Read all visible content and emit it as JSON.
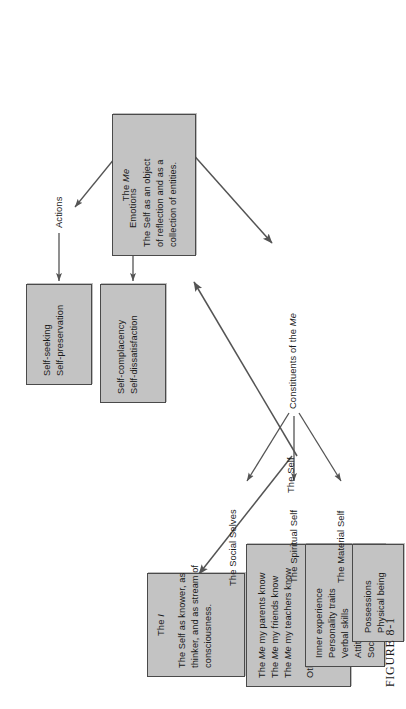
{
  "figure": {
    "caption_label": "FIGURE",
    "caption_number": "8-1"
  },
  "colors": {
    "box_fill": "#c3c3c3",
    "box_border": "#4a4a4a",
    "arrow": "#545454",
    "text": "#1a1a1a",
    "page": "#ffffff"
  },
  "diagram": {
    "type": "tree",
    "root": {
      "label": "The Self"
    },
    "nodes": {
      "the_i": {
        "title_prefix": "The ",
        "title_italic": "I",
        "body": [
          "The Self as knower, as",
          "thinker, and as stream of",
          "consciousness."
        ]
      },
      "the_me": {
        "title_prefix": "The ",
        "title_italic": "Me",
        "body": [
          "The Self as an object",
          "of reflection and as a",
          "collection of entities."
        ]
      },
      "emotions": {
        "label": "Emotions"
      },
      "actions": {
        "label": "Actions"
      },
      "emotions_box": {
        "items": [
          "Self-complacency",
          "Self-dissatisfaction"
        ]
      },
      "actions_box": {
        "items": [
          "Self-seeking",
          "Self-preservation"
        ]
      },
      "constituents": {
        "label_prefix": "Constituents of the ",
        "label_italic": "Me"
      },
      "material_self": {
        "label": "The Material Self",
        "items": [
          "Possessions",
          "Physical being"
        ]
      },
      "spiritual_self": {
        "label": "The Spiritual Self",
        "items": [
          "Inner experience",
          "Personality traits",
          "Verbal skills",
          "Attitudes",
          "Social perceptions"
        ]
      },
      "social_selves": {
        "label": "The Social Selves",
        "items_a": [
          {
            "pre": "The ",
            "it": "Me",
            "post": " my parents know"
          },
          {
            "pre": "The ",
            "it": "Me",
            "post": " my friends know"
          },
          {
            "pre": "The ",
            "it": "Me",
            "post": " my teachers know"
          }
        ],
        "items_b": [
          {
            "pre": "Other Social  ",
            "it": "Mes",
            "post": ""
          }
        ]
      }
    },
    "edges": [
      {
        "from": "The Self",
        "to": "The I"
      },
      {
        "from": "The Self",
        "to": "The Me"
      },
      {
        "from": "The Me",
        "to": "Emotions"
      },
      {
        "from": "The Me",
        "to": "Actions"
      },
      {
        "from": "The Me",
        "to": "Constituents of the Me"
      },
      {
        "from": "Emotions",
        "to": "Emotions box"
      },
      {
        "from": "Actions",
        "to": "Actions box"
      },
      {
        "from": "Constituents of the Me",
        "to": "The Material Self"
      },
      {
        "from": "Constituents of the Me",
        "to": "The Spiritual Self"
      },
      {
        "from": "Constituents of the Me",
        "to": "The Social Selves"
      }
    ]
  }
}
